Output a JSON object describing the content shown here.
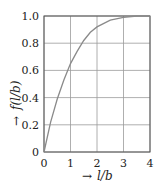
{
  "chart_data": {
    "type": "line",
    "title": "",
    "xlabel": "l/b",
    "ylabel": "f(l/b)",
    "xlabel_prefix": "→",
    "ylabel_prefix": "→",
    "xlim": [
      0,
      4
    ],
    "ylim": [
      0,
      1.0
    ],
    "grid": true,
    "legend": "none",
    "x_ticks": [
      "0",
      "1",
      "2",
      "3",
      "4"
    ],
    "y_ticks": [
      "0",
      "0.2",
      "0.4",
      "0.6",
      "0.8",
      "1.0"
    ],
    "series": [
      {
        "name": "f(l/b)",
        "x": [
          0,
          0.25,
          0.5,
          0.75,
          1.0,
          1.25,
          1.5,
          1.75,
          2.0,
          2.5,
          3.0,
          3.5,
          4.0
        ],
        "values": [
          0,
          0.22,
          0.39,
          0.53,
          0.65,
          0.74,
          0.82,
          0.88,
          0.92,
          0.97,
          0.99,
          1.0,
          1.0
        ]
      }
    ],
    "line_color": "#8a8a8a",
    "grid_color": "#9a9a9a"
  }
}
